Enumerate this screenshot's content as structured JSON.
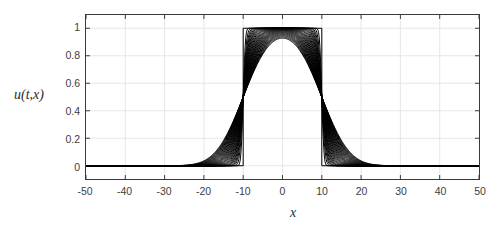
{
  "chart_data": {
    "type": "line",
    "title": "",
    "xlabel": "x",
    "ylabel": "u(t,x)",
    "xlim": [
      -50,
      50
    ],
    "ylim": [
      -0.0964,
      1.0964
    ],
    "grid": true,
    "legend": null,
    "line_color": "#000000",
    "axis_color": "#3a3a3a",
    "grid_color": "#e6e6e6",
    "xticks": [
      -50,
      -40,
      -30,
      -20,
      -10,
      0,
      10,
      20,
      30,
      40,
      50
    ],
    "xtick_labels": [
      "-50",
      "-40",
      "-30",
      "-20",
      "-10",
      "0",
      "10",
      "20",
      "30",
      "40",
      "50"
    ],
    "yticks": [
      0,
      0.2,
      0.4,
      0.6,
      0.8,
      1
    ],
    "ytick_labels": [
      "0",
      "0.2",
      "0.4",
      "0.6",
      "0.8",
      "1"
    ],
    "initial_pulse": {
      "left_edge": -10,
      "right_edge": 10,
      "height": 1,
      "baseline": 0
    },
    "series": [
      {
        "name": "t=0.00",
        "diffusion_width": 0.0,
        "peak": 1.0
      },
      {
        "name": "t=0.05",
        "diffusion_width": 0.62,
        "peak": 1.0
      },
      {
        "name": "t=0.10",
        "diffusion_width": 0.95,
        "peak": 1.0
      },
      {
        "name": "t=0.15",
        "diffusion_width": 1.22,
        "peak": 1.0
      },
      {
        "name": "t=0.20",
        "diffusion_width": 1.45,
        "peak": 1.0
      },
      {
        "name": "t=0.25",
        "diffusion_width": 1.68,
        "peak": 1.0
      },
      {
        "name": "t=0.30",
        "diffusion_width": 1.9,
        "peak": 1.0
      },
      {
        "name": "t=0.35",
        "diffusion_width": 2.12,
        "peak": 0.999
      },
      {
        "name": "t=0.40",
        "diffusion_width": 2.35,
        "peak": 0.999
      },
      {
        "name": "t=0.45",
        "diffusion_width": 2.6,
        "peak": 0.999
      },
      {
        "name": "t=0.50",
        "diffusion_width": 2.85,
        "peak": 0.998
      },
      {
        "name": "t=0.55",
        "diffusion_width": 3.1,
        "peak": 0.998
      },
      {
        "name": "t=0.60",
        "diffusion_width": 3.35,
        "peak": 0.997
      },
      {
        "name": "t=0.65",
        "diffusion_width": 3.6,
        "peak": 0.996
      },
      {
        "name": "t=0.70",
        "diffusion_width": 3.85,
        "peak": 0.995
      },
      {
        "name": "t=0.75",
        "diffusion_width": 4.1,
        "peak": 0.993
      },
      {
        "name": "t=0.80",
        "diffusion_width": 4.35,
        "peak": 0.991
      },
      {
        "name": "t=0.85",
        "diffusion_width": 4.6,
        "peak": 0.988
      },
      {
        "name": "t=0.90",
        "diffusion_width": 4.85,
        "peak": 0.985
      },
      {
        "name": "t=0.95",
        "diffusion_width": 5.1,
        "peak": 0.981
      },
      {
        "name": "t=1.00",
        "diffusion_width": 5.35,
        "peak": 0.976
      },
      {
        "name": "t=1.05",
        "diffusion_width": 5.6,
        "peak": 0.97
      },
      {
        "name": "t=1.10",
        "diffusion_width": 5.85,
        "peak": 0.963
      },
      {
        "name": "t=1.15",
        "diffusion_width": 6.1,
        "peak": 0.955
      },
      {
        "name": "t=1.20",
        "diffusion_width": 6.35,
        "peak": 0.946
      },
      {
        "name": "t=1.25",
        "diffusion_width": 6.6,
        "peak": 0.935
      },
      {
        "name": "t=1.30",
        "diffusion_width": 6.85,
        "peak": 0.923
      },
      {
        "name": "t=1.35",
        "diffusion_width": 7.1,
        "peak": 0.91
      },
      {
        "name": "t=1.40",
        "diffusion_width": 7.35,
        "peak": 0.896
      },
      {
        "name": "t=1.45",
        "diffusion_width": 7.6,
        "peak": 0.881
      },
      {
        "name": "t=1.50",
        "diffusion_width": 7.85,
        "peak": 0.865
      }
    ]
  }
}
